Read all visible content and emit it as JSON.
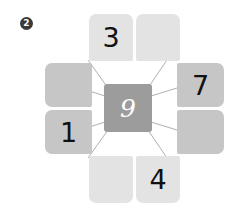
{
  "marker": {
    "label": "2",
    "shape": "filled-circle"
  },
  "puzzle": {
    "type": "number-web",
    "center": {
      "value": "9",
      "color": "#9c9c9c",
      "text_color": "#ffffff"
    },
    "colors": {
      "light_tile": "#e3e3e3",
      "medium_tile": "#c6c6c6",
      "line": "#b0b0b0",
      "background": "#ffffff"
    },
    "tiles": [
      {
        "position": "top-left",
        "value": "3",
        "shade": "light"
      },
      {
        "position": "top-right",
        "value": "",
        "shade": "light"
      },
      {
        "position": "left-upper",
        "value": "",
        "shade": "medium"
      },
      {
        "position": "left-lower",
        "value": "1",
        "shade": "medium"
      },
      {
        "position": "right-upper",
        "value": "7",
        "shade": "medium"
      },
      {
        "position": "right-lower",
        "value": "",
        "shade": "medium"
      },
      {
        "position": "bottom-left",
        "value": "",
        "shade": "light"
      },
      {
        "position": "bottom-right",
        "value": "4",
        "shade": "light"
      }
    ]
  }
}
